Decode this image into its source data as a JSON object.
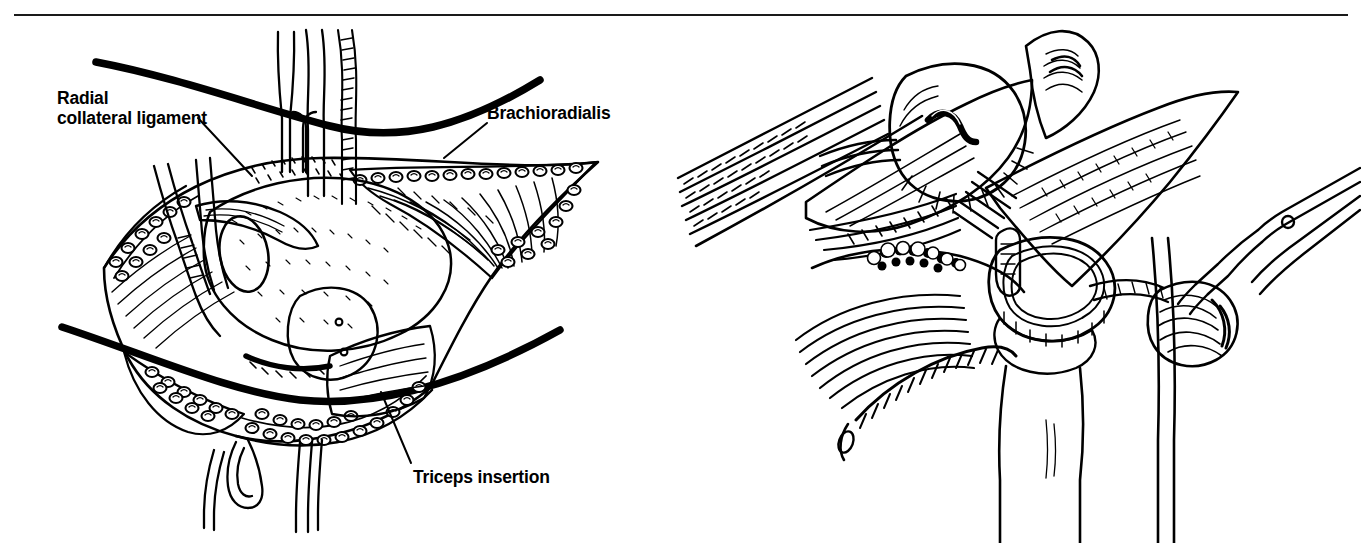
{
  "figure": {
    "type": "surgical-anatomical-illustration",
    "style": "pen-and-ink line drawing, black on white",
    "panel_count": 2,
    "colors": {
      "ink": "#000000",
      "background": "#ffffff",
      "rule": "#1a1a1a"
    },
    "divider_rule": {
      "present": true,
      "position": "top",
      "width_px": 1334
    }
  },
  "labels": {
    "radial_collateral_ligament": "Radial\ncollateral ligament",
    "brachioradialis": "Brachioradialis",
    "triceps_insertion": "Triceps insertion"
  },
  "panels": [
    {
      "id": "left",
      "name": "operative-exposure-view",
      "description": "Open surgical wound of the lateral elbow held apart by retractors, showing subcutaneous fat globules along the wound edges, muscle fibers, the radial collateral ligament and the triceps insertion.",
      "elements": [
        "skin-contour-upper",
        "skin-contour-lower",
        "wound-edge-fat",
        "two-prong-retractor",
        "single-prong-retractors",
        "forceps",
        "brachioradialis-muscle",
        "radial-collateral-ligament",
        "triceps-insertion",
        "capsule-exposure"
      ],
      "labels": [
        "radial_collateral_ligament",
        "brachioradialis",
        "triceps_insertion"
      ]
    },
    {
      "id": "right",
      "name": "joint-detail-view",
      "description": "Close-up of the opened elbow joint showing the capitellum with an osteochondral defect, the radial head and neck, the ulna, overlying muscle fibers and a pair of surgical scissors dividing tissue.",
      "elements": [
        "capitellum",
        "osteochondral-lesion",
        "radial-head",
        "radial-neck",
        "ulna",
        "annular-ligament",
        "muscle-fiber-hatching",
        "retracted-capsule-flap",
        "surgical-scissors"
      ],
      "labels": []
    }
  ]
}
